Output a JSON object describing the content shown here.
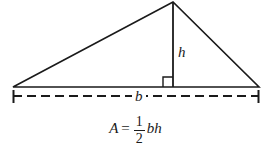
{
  "figure": {
    "name": "triangle-area-diagram",
    "background_color": "#ffffff",
    "stroke_color": "#1a1a1a",
    "labels": {
      "height": "h",
      "base": "b"
    },
    "formula": {
      "variable": "A",
      "equals": "=",
      "numerator": "1",
      "denominator": "2",
      "tail": "bh",
      "full_text": "A = 1/2 bh"
    },
    "geometry": {
      "left_vertex": [
        13,
        87
      ],
      "apex": [
        173,
        2
      ],
      "right_vertex": [
        259,
        87
      ],
      "height_foot": [
        173,
        87
      ],
      "right_angle_marker": [
        163,
        77,
        10,
        10
      ],
      "dimension_line_y": 96,
      "dimension_left_x": 13,
      "dimension_right_x": 259
    }
  }
}
